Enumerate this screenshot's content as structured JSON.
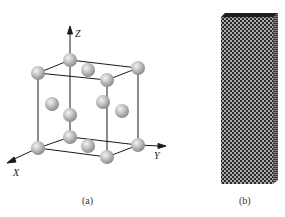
{
  "figure": {
    "panels": [
      {
        "id": "a",
        "caption": "(a)",
        "description": "Face-centered cubic unit cell with atoms at corners and face centers",
        "axes": {
          "x_label": "X",
          "y_label": "Y",
          "z_label": "Z"
        },
        "atom_color": "#b8b8b8",
        "edge_color": "#1a1a1a"
      },
      {
        "id": "b",
        "caption": "(b)",
        "description": "Rectangular nanowire/pillar built from stacked atomic lattice",
        "fill_dark": "#2a2a2a",
        "fill_light": "#e8e8e8"
      }
    ]
  }
}
